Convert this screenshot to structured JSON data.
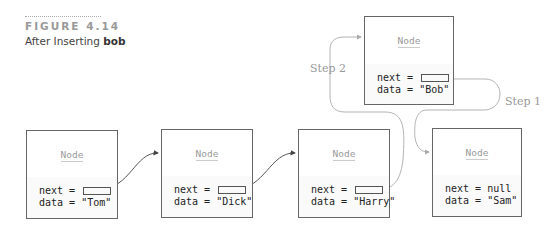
{
  "figure": {
    "number": "FIGURE 4.14",
    "caption_prefix": "After Inserting ",
    "caption_bold": "bob"
  },
  "node_title": "Node",
  "nodes": [
    {
      "id": "tom",
      "next_label": "next = ",
      "next_value": "",
      "data_label": "data = \"Tom\""
    },
    {
      "id": "dick",
      "next_label": "next = ",
      "next_value": "",
      "data_label": "data = \"Dick\""
    },
    {
      "id": "harry",
      "next_label": "next = ",
      "next_value": "",
      "data_label": "data = \"Harry\""
    },
    {
      "id": "sam",
      "next_label": "next = null",
      "next_value": "null",
      "data_label": "data = \"Sam\""
    },
    {
      "id": "bob",
      "next_label": "next = ",
      "next_value": "",
      "data_label": "data = \"Bob\""
    }
  ],
  "steps": {
    "step1": "Step 1",
    "step2": "Step 2"
  },
  "colors": {
    "border": "#666666",
    "arrow_dark": "#444444",
    "arrow_light": "#aaaaaa",
    "muted_text": "#999999"
  }
}
